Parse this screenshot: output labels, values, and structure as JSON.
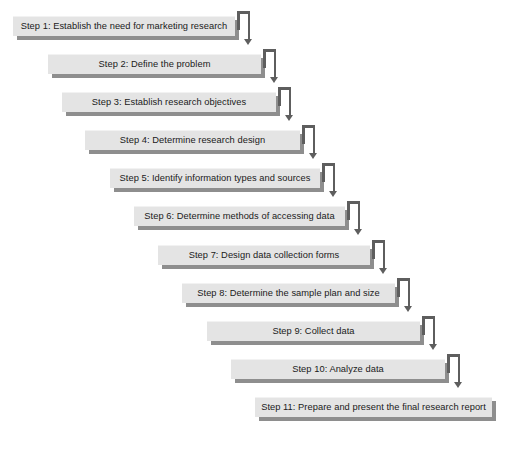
{
  "diagram": {
    "type": "staircase-flowchart",
    "orientation": "top-left to bottom-right",
    "background_color": "#ffffff",
    "box_fill_color": "#e4e4e4",
    "box_shadow_color": "#8e8e8e",
    "connector_color": "#5e5e5e",
    "text_color": "#1a1a1a",
    "step_count": 11,
    "steps": [
      {
        "number": 1,
        "label": "Step 1: Establish the need for marketing research",
        "left": 13,
        "top": 16,
        "width": 222
      },
      {
        "number": 2,
        "label": "Step 2: Define the problem",
        "left": 48,
        "top": 54,
        "width": 213
      },
      {
        "number": 3,
        "label": "Step 3: Establish research objectives",
        "left": 62,
        "top": 92,
        "width": 214
      },
      {
        "number": 4,
        "label": "Step 4: Determine research design",
        "left": 85,
        "top": 130,
        "width": 215
      },
      {
        "number": 5,
        "label": "Step 5: Identify information types and sources",
        "left": 110,
        "top": 168,
        "width": 210
      },
      {
        "number": 6,
        "label": "Step 6: Determine methods of accessing data",
        "left": 134,
        "top": 206,
        "width": 211
      },
      {
        "number": 7,
        "label": "Step 7: Design data collection forms",
        "left": 158,
        "top": 245,
        "width": 212
      },
      {
        "number": 8,
        "label": "Step 8: Determine the sample plan and size",
        "left": 182,
        "top": 283,
        "width": 213
      },
      {
        "number": 9,
        "label": "Step 9: Collect data",
        "left": 207,
        "top": 321,
        "width": 213
      },
      {
        "number": 10,
        "label": "Step 10: Analyze data",
        "left": 231,
        "top": 359,
        "width": 214
      },
      {
        "number": 11,
        "label": "Step 11: Prepare and present the final research report",
        "left": 255,
        "top": 397,
        "width": 237
      }
    ]
  }
}
